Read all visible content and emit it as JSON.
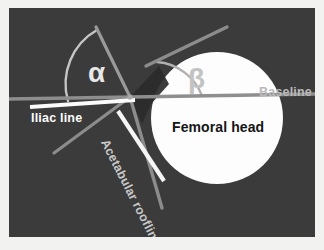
{
  "figure": {
    "width": 324,
    "height": 250,
    "background_color": "#3b3b3b",
    "border_color": "#f2f2f0"
  },
  "labels": {
    "iliac_line": "Iliac line",
    "femoral_head": "Femoral head",
    "baseline": "Baseline",
    "acetabular_roofline": "Acetabular roofline",
    "alpha": "α",
    "beta": "β"
  },
  "colors": {
    "background": "#3b3b3b",
    "frame": "#f2f2f0",
    "femoral_head_fill": "#fdfdfd",
    "baseline_stroke": "#8e8e8e",
    "iliac_bar": "#fbfbfb",
    "roofline_white": "#f5f5f5",
    "ray_gray": "#8c8c8c",
    "arc_light": "#c6c6c6",
    "arc_beta": "#b0b0b0",
    "wedge_dark": "#2a2a2a",
    "alpha_text": "#e8e8e8",
    "beta_text": "#c3c3c3",
    "femoral_text": "#151515",
    "baseline_text": "#b9b9b9",
    "roofline_text": "#c9c9c9",
    "iliac_text": "#fbfbfb"
  },
  "geometry": {
    "femoral_head": {
      "cx": 208,
      "cy": 110,
      "r": 66
    },
    "vertex": {
      "x": 121,
      "y": 89
    },
    "baseline": {
      "x1": 0,
      "y1": 90,
      "x2": 306,
      "y2": 86
    },
    "iliac_bar": {
      "x1": 22,
      "y1": 98,
      "x2": 124,
      "y2": 92
    },
    "alpha_ray": {
      "x1": 121,
      "y1": 89,
      "x2": 88,
      "y2": 20
    },
    "lower_left_ray": {
      "x1": 121,
      "y1": 89,
      "x2": 46,
      "y2": 144
    },
    "roofline_ray": {
      "x1": 121,
      "y1": 89,
      "x2": 152,
      "y2": 198
    },
    "roofline_white_bar": {
      "x1": 110,
      "y1": 104,
      "x2": 154,
      "y2": 172
    },
    "beta_ray": {
      "x1": 141,
      "y1": 54,
      "x2": 216,
      "y2": 20
    },
    "alpha_arc_radius": 62,
    "beta_arc_radius": 52
  },
  "annotations": {
    "alpha_angle_name": "alpha angle",
    "beta_angle_name": "beta angle"
  }
}
